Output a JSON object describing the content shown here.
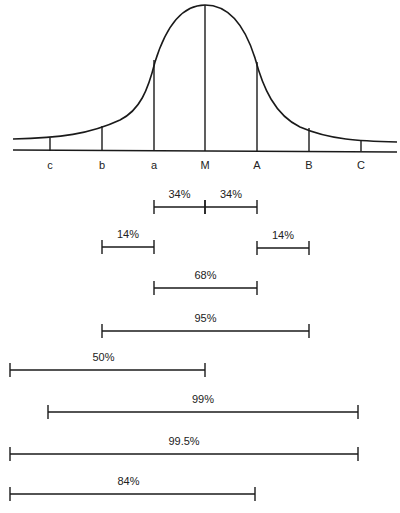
{
  "diagram": {
    "line_color": "#1a1a1a",
    "markers": [
      {
        "label": "c",
        "x": 50,
        "top": 138
      },
      {
        "label": "b",
        "x": 102,
        "top": 126
      },
      {
        "label": "a",
        "x": 154,
        "top": 60
      },
      {
        "label": "M",
        "x": 205,
        "top": 5
      },
      {
        "label": "A",
        "x": 257,
        "top": 62
      },
      {
        "label": "B",
        "x": 309,
        "top": 128
      },
      {
        "label": "C",
        "x": 361,
        "top": 140
      }
    ],
    "brackets": [
      {
        "label": "34%",
        "x1": 154,
        "x2": 205,
        "y": 207
      },
      {
        "label": "34%",
        "x1": 205,
        "x2": 257,
        "y": 207
      },
      {
        "label": "14%",
        "x1": 102,
        "x2": 154,
        "y": 247
      },
      {
        "label": "14%",
        "x1": 257,
        "x2": 309,
        "y": 248
      },
      {
        "label": "68%",
        "x1": 154,
        "x2": 257,
        "y": 288
      },
      {
        "label": "95%",
        "x1": 102,
        "x2": 309,
        "y": 331
      },
      {
        "label": "50%",
        "x1": 10,
        "x2": 205,
        "y": 370
      },
      {
        "label": "99%",
        "x1": 48,
        "x2": 358,
        "y": 412
      },
      {
        "label": "99.5%",
        "x1": 10,
        "x2": 358,
        "y": 454
      },
      {
        "label": "84%",
        "x1": 10,
        "x2": 255,
        "y": 494
      }
    ]
  }
}
